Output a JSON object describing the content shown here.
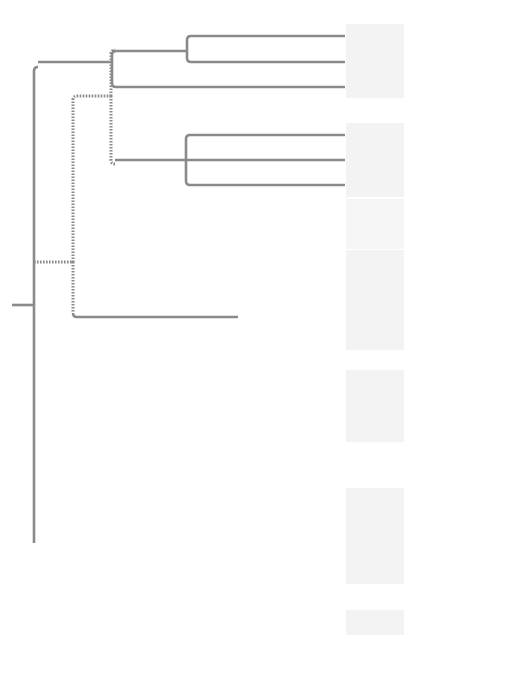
{
  "diagram": {
    "type": "phylogenetic-tree",
    "colors": {
      "branch": "#8a8a8a",
      "band": "#f3f3f3",
      "group_label_bg": "#e2e2e2",
      "clade_excavata": "#7a7a7a",
      "clade_sar": "#8c8c8c",
      "clade_archaeplastida": "#5f5f5f",
      "clade_unikonta": "#5a5a5a"
    },
    "supergroups": [
      {
        "id": "excavata",
        "label": "Excavata",
        "taxa": [
          "Diplomonads",
          "Parabasalids",
          "Euglenozoans"
        ]
      },
      {
        "id": "sar",
        "label": "SAR",
        "groups": [
          {
            "label": "Stramenopiles",
            "taxa": [
              "Diatoms",
              "Golden algae",
              "Brown algae"
            ]
          },
          {
            "label": "Alveolates",
            "taxa": [
              "Dinoflagellates",
              "Apicomplexans",
              "Ciliates"
            ]
          },
          {
            "label": "Rhizarians",
            "taxa": [
              "Radiolarians",
              "Forams",
              "Cercozoans"
            ]
          }
        ]
      },
      {
        "id": "archaeplastida",
        "label": "Archaeplastida",
        "taxa": [
          "Red algae",
          "Chlorophytes",
          "Charophytes",
          "Plants"
        ],
        "groups": [
          {
            "label": "Green algae",
            "taxa": [
              "Chlorophytes",
              "Charophytes"
            ]
          }
        ]
      },
      {
        "id": "unikonta",
        "label": "Unikonta",
        "groups": [
          {
            "label": "Amoebozoans",
            "taxa": [
              "Slime molds",
              "Tubulinids",
              "Entamoebas"
            ]
          },
          {
            "label": "Opisthokonts",
            "taxa": [
              "Nucleariids",
              "Fungi",
              "Choanoflagellates",
              "Animals"
            ]
          }
        ]
      }
    ],
    "leaves": [
      "Diplomonads",
      "Parabasalids",
      "Euglenozoans",
      "Diatoms",
      "Golden algae",
      "Brown algae",
      "Dinoflagellates",
      "Apicomplexans",
      "Ciliates",
      "Radiolarians",
      "Forams",
      "Cercozoans",
      "Red algae",
      "Chlorophytes",
      "Charophytes",
      "Plants",
      "Slime molds",
      "Tubulinids",
      "Entamoebas",
      "Nucleariids",
      "Fungi",
      "Choanoflagellates",
      "Animals"
    ],
    "group_labels": {
      "stramenopiles": "Stramenopiles",
      "alveolates": "Alveolates",
      "rhizarians": "Rhizarians",
      "green_algae_1": "Green",
      "green_algae_2": "algae",
      "amoebozoans": "Amoebozoans",
      "opisthokonts": "Opisthokonts"
    },
    "clade_labels": {
      "excavata": "Excavata",
      "sar": "SAR",
      "archaeplastida": "Archaeplastida",
      "unikonta": "Unikonta"
    }
  }
}
